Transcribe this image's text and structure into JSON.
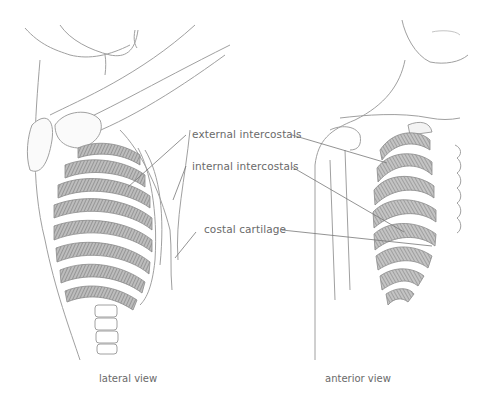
{
  "figure": {
    "labels": [
      {
        "id": "external",
        "text": "external intercostals"
      },
      {
        "id": "internal",
        "text": "internal intercostals"
      },
      {
        "id": "cartilage",
        "text": "costal cartilage"
      }
    ],
    "captions": {
      "lateral": "lateral view",
      "anterior": "anterior view"
    }
  },
  "colors": {
    "line": "#9a9a9a",
    "muscle": "#8f8f8f",
    "label_text": "#6a6a6a",
    "background": "#ffffff"
  }
}
